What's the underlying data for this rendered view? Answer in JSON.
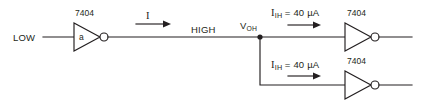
{
  "diagram": {
    "background_color": "#ffffff",
    "line_color": "#231f20"
  },
  "labels": {
    "input_level": "LOW",
    "driver_part_number": "7404",
    "driver_gate_id": "a",
    "drive_current": "I",
    "output_level": "HIGH",
    "node_voltage_symbol": "V",
    "node_voltage_subscript": "OH",
    "load_current_symbol": "I",
    "load_current_subscript": "IH",
    "load_current_value": "= 40 µA",
    "load_top_part_number": "7404",
    "load_bottom_part_number": "7404"
  },
  "branches": [
    {
      "name": "top-load-branch",
      "current_symbol": "I",
      "current_subscript": "IH",
      "current_value": "= 40 µA",
      "part_number": "7404"
    },
    {
      "name": "bottom-load-branch",
      "current_symbol": "I",
      "current_subscript": "IH",
      "current_value": "= 40 µA",
      "part_number": "7404"
    }
  ]
}
